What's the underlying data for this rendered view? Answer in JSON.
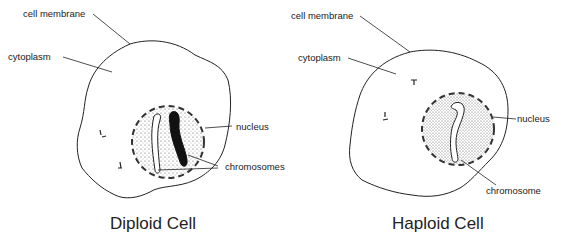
{
  "diagram": {
    "panels": [
      {
        "title": "Diploid Cell",
        "labels": {
          "cell_membrane": "cell membrane",
          "cytoplasm": "cytoplasm",
          "nucleus": "nucleus",
          "chromosomes": "chromosomes"
        },
        "chromosome_count": 2
      },
      {
        "title": "Haploid Cell",
        "labels": {
          "cell_membrane": "cell membrane",
          "cytoplasm": "cytoplasm",
          "nucleus": "nucleus",
          "chromosome": "chromosome"
        },
        "chromosome_count": 1
      }
    ],
    "colors": {
      "line": "#222222",
      "background": "#ffffff",
      "stipple": "#555555"
    }
  }
}
